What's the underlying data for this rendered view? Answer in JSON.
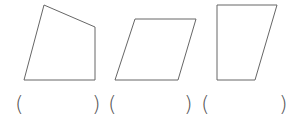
{
  "diagram": {
    "stroke_color": "#666666",
    "shapes": [
      {
        "name": "quadrilateral-1",
        "points": "44,5 95,27 95,80 24,80"
      },
      {
        "name": "parallelogram-2",
        "points": "135,19 196,19 178,80 115,80"
      },
      {
        "name": "trapezoid-3",
        "points": "217,5 277,5 255,80 217,80"
      }
    ],
    "answer_blanks": [
      {
        "open": "(",
        "close": ")"
      },
      {
        "open": "(",
        "close": ")"
      },
      {
        "open": "(",
        "close": ")"
      }
    ]
  }
}
